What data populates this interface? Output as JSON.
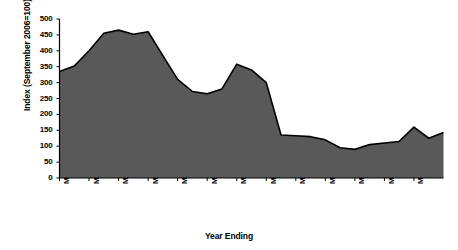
{
  "chart_data": {
    "type": "area",
    "title": "",
    "xlabel": "Year Ending",
    "ylabel": "Index (September 2006=100)",
    "ylim": [
      0,
      500
    ],
    "ytick_values": [
      0,
      50,
      100,
      150,
      200,
      250,
      300,
      350,
      400,
      450,
      500
    ],
    "ytick_labels": [
      "0",
      "50",
      "100",
      "150",
      "200",
      "250",
      "300",
      "350",
      "400",
      "450",
      "500"
    ],
    "xtick_labels": [
      "Mar-85",
      "Mar-87",
      "Mar-89",
      "Mar-91",
      "Mar-93",
      "Mar-95",
      "Mar-97",
      "Mar-99",
      "Mar-01",
      "Mar-03",
      "Mar-05",
      "Mar-07",
      "Mar-09"
    ],
    "xtick_years": [
      1985,
      1987,
      1989,
      1991,
      1993,
      1995,
      1997,
      1999,
      2001,
      2003,
      2005,
      2007,
      2009
    ],
    "x": [
      1985,
      1986,
      1987,
      1988,
      1989,
      1990,
      1991,
      1992,
      1993,
      1994,
      1995,
      1996,
      1997,
      1998,
      1999,
      2000,
      2001,
      2002,
      2003,
      2004,
      2005,
      2006,
      2007,
      2008,
      2009,
      2010,
      2011
    ],
    "x_labels": [
      "Mar-85",
      "Mar-86",
      "Mar-87",
      "Mar-88",
      "Mar-89",
      "Mar-90",
      "Mar-91",
      "Mar-92",
      "Mar-93",
      "Mar-94",
      "Mar-95",
      "Mar-96",
      "Mar-97",
      "Mar-98",
      "Mar-99",
      "Mar-00",
      "Mar-01",
      "Mar-02",
      "Mar-03",
      "Mar-04",
      "Mar-05",
      "Mar-06",
      "Mar-07",
      "Mar-08",
      "Mar-09",
      "Mar-10",
      "Mar-11"
    ],
    "values": [
      335,
      352,
      400,
      455,
      465,
      452,
      460,
      385,
      310,
      272,
      265,
      280,
      358,
      340,
      300,
      135,
      133,
      130,
      120,
      95,
      90,
      105,
      110,
      115,
      160,
      125,
      118
    ],
    "series": [
      {
        "name": "Index (September 2006=100)",
        "values": [
          335,
          352,
          400,
          455,
          465,
          452,
          460,
          385,
          310,
          272,
          265,
          280,
          358,
          340,
          300,
          135,
          133,
          130,
          120,
          95,
          90,
          105,
          110,
          115,
          160,
          125,
          118
        ]
      }
    ],
    "last_point_value": 143,
    "grid": false,
    "legend": "none",
    "fill_color": "#595959",
    "line_color": "#000000",
    "background_color": "#ffffff"
  },
  "axes": {
    "y_axis_title": "Index (September 2006=100)",
    "x_axis_title": "Year Ending"
  }
}
